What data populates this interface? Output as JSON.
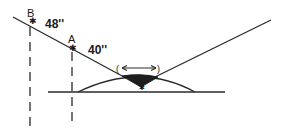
{
  "diagram": {
    "points": [
      {
        "id": "B",
        "label": "B",
        "value": "48''"
      },
      {
        "id": "A",
        "label": "A",
        "value": "40''"
      }
    ],
    "arrow": {
      "left_paren": "(",
      "right_paren": ")"
    },
    "colors": {
      "line": "#2a2a2a",
      "fill": "#1e1e1e",
      "background": "#ffffff"
    }
  }
}
